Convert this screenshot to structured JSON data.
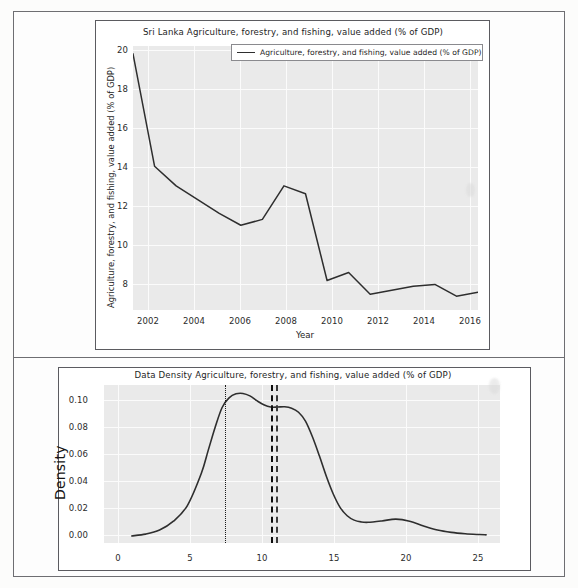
{
  "document": {
    "kind": "scanned-report-page",
    "panel_count": 2
  },
  "top_chart": {
    "title": "Sri Lanka Agriculture, forestry, and fishing, value added (% of GDP)",
    "legend": {
      "entries": [
        {
          "label": "Agriculture, forestry, and fishing, value added (% of GDP)",
          "color": "#2e2e2e"
        }
      ]
    },
    "xlabel": "Year",
    "ylabel": "Agriculture, forestry, and fishing, value added (% of GDP)",
    "xticks": [
      "2002",
      "2004",
      "2006",
      "2008",
      "2010",
      "2012",
      "2014",
      "2016"
    ],
    "yticks": [
      "20",
      "18",
      "16",
      "14",
      "12",
      "10",
      "8"
    ]
  },
  "bottom_chart": {
    "title": "Data Density Agriculture, forestry, and fishing, value added (% of GDP)",
    "ylabel": "Density",
    "xticks": [
      "0",
      "5",
      "10",
      "15",
      "20",
      "25"
    ],
    "yticks": [
      "0.10",
      "0.08",
      "0.06",
      "0.04",
      "0.02",
      "0.00"
    ]
  },
  "chart_data": [
    {
      "type": "line",
      "title": "Sri Lanka Agriculture, forestry, and fishing, value added (% of GDP)",
      "xlabel": "Year",
      "ylabel": "Agriculture, forestry, and fishing, value added (% of GDP)",
      "grid": true,
      "legend_position": "upper right",
      "xlim": [
        2001,
        2017
      ],
      "ylim": [
        7.0,
        20.4
      ],
      "xticks": [
        2002,
        2004,
        2006,
        2008,
        2010,
        2012,
        2014,
        2016
      ],
      "yticks": [
        8,
        10,
        12,
        14,
        16,
        18,
        20
      ],
      "series": [
        {
          "name": "Agriculture, forestry, and fishing, value added (% of GDP)",
          "color": "#2e2e2e",
          "x": [
            2001,
            2002,
            2003,
            2004,
            2005,
            2006,
            2007,
            2008,
            2009,
            2010,
            2011,
            2012,
            2013,
            2014,
            2015,
            2016,
            2017
          ],
          "values": [
            20.0,
            14.3,
            13.3,
            12.6,
            11.9,
            11.3,
            11.6,
            13.3,
            12.9,
            8.5,
            8.9,
            7.8,
            8.0,
            8.2,
            8.3,
            7.7,
            7.9
          ]
        }
      ]
    },
    {
      "type": "line",
      "subtype": "kde-density",
      "title": "Data Density Agriculture, forestry, and fishing, value added (% of GDP)",
      "xlabel": "",
      "ylabel": "Density",
      "grid": true,
      "xlim": [
        -1.0,
        27.5
      ],
      "ylim": [
        -0.004,
        0.112
      ],
      "xticks": [
        0,
        5,
        10,
        15,
        20,
        25
      ],
      "yticks": [
        0.0,
        0.02,
        0.04,
        0.06,
        0.08,
        0.1
      ],
      "series": [
        {
          "name": "Density",
          "color": "#2e2e2e",
          "x": [
            1.0,
            2.0,
            3.0,
            4.0,
            5.0,
            6.0,
            6.5,
            7.0,
            7.5,
            8.0,
            8.5,
            9.0,
            9.5,
            10.0,
            10.5,
            11.0,
            11.5,
            12.0,
            12.5,
            13.0,
            13.5,
            14.0,
            14.5,
            15.0,
            15.5,
            16.0,
            16.5,
            17.0,
            17.5,
            18.0,
            19.0,
            20.0,
            21.0,
            22.0,
            23.0,
            24.0,
            25.0,
            26.0,
            26.5
          ],
          "values": [
            0.0012,
            0.0025,
            0.0055,
            0.012,
            0.0235,
            0.047,
            0.064,
            0.081,
            0.0955,
            0.1025,
            0.1055,
            0.1058,
            0.104,
            0.1005,
            0.0975,
            0.0958,
            0.0958,
            0.096,
            0.095,
            0.092,
            0.0855,
            0.074,
            0.06,
            0.045,
            0.032,
            0.022,
            0.016,
            0.0128,
            0.0115,
            0.0112,
            0.0122,
            0.0135,
            0.012,
            0.0085,
            0.0055,
            0.0038,
            0.0028,
            0.0022,
            0.002
          ]
        }
      ],
      "reference_lines": [
        {
          "name": "mode-line",
          "x": 7.7,
          "style": "dotted",
          "color": "#1a1a1a"
        },
        {
          "name": "median-line",
          "x": 11.0,
          "style": "dashed",
          "color": "#0e0e0e"
        },
        {
          "name": "mean-line",
          "x": 11.4,
          "style": "dashdot",
          "color": "#3a3a3a"
        }
      ]
    }
  ]
}
